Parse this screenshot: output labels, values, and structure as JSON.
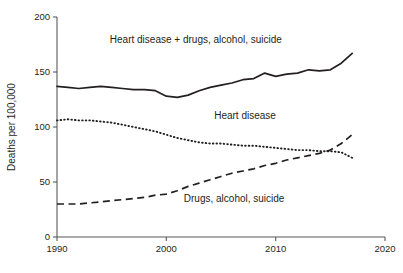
{
  "chart_data": {
    "type": "line",
    "title": "",
    "xlabel": "",
    "ylabel": "Deaths per 100,000",
    "xlim": [
      1990,
      2020
    ],
    "ylim": [
      0,
      200
    ],
    "xticks": [
      "1990",
      "2000",
      "2010",
      "2020"
    ],
    "yticks": [
      "0",
      "50",
      "100",
      "150",
      "200"
    ],
    "grid": false,
    "legend_position": "inline-annotations",
    "x": [
      1990,
      1991,
      1992,
      1993,
      1994,
      1995,
      1996,
      1997,
      1998,
      1999,
      2000,
      2001,
      2002,
      2003,
      2004,
      2005,
      2006,
      2007,
      2008,
      2009,
      2010,
      2011,
      2012,
      2013,
      2014,
      2015,
      2016,
      2017
    ],
    "series": [
      {
        "name": "Heart disease + drugs, alcohol, suicide",
        "style": "solid",
        "label_text": "Heart disease + drugs, alcohol, suicide",
        "values": [
          137,
          136,
          135,
          136,
          137,
          136,
          135,
          134,
          134,
          133,
          128,
          127,
          129,
          133,
          136,
          138,
          140,
          143,
          144,
          149,
          146,
          148,
          149,
          152,
          151,
          152,
          158,
          167
        ]
      },
      {
        "name": "Heart disease",
        "style": "dotted",
        "label_text": "Heart disease",
        "values": [
          106,
          107,
          106,
          106,
          105,
          104,
          102,
          100,
          98,
          96,
          93,
          90,
          88,
          86,
          85,
          85,
          84,
          83,
          83,
          82,
          81,
          80,
          79,
          79,
          78,
          78,
          77,
          72
        ]
      },
      {
        "name": "Drugs, alcohol, suicide",
        "style": "dashed",
        "label_text": "Drugs, alcohol, suicide",
        "values": [
          30,
          30,
          30,
          31,
          32,
          33,
          34,
          35,
          36,
          38,
          39,
          42,
          46,
          49,
          52,
          55,
          58,
          60,
          62,
          65,
          67,
          70,
          72,
          74,
          76,
          79,
          85,
          93
        ]
      }
    ],
    "annotations": [
      {
        "text": "Heart disease + drugs, alcohol, suicide",
        "x": 2002.7,
        "y": 176
      },
      {
        "text": "Heart disease",
        "x": 2007.2,
        "y": 107
      },
      {
        "text": "Drugs, alcohol, suicide",
        "x": 2006.2,
        "y": 32
      }
    ]
  }
}
